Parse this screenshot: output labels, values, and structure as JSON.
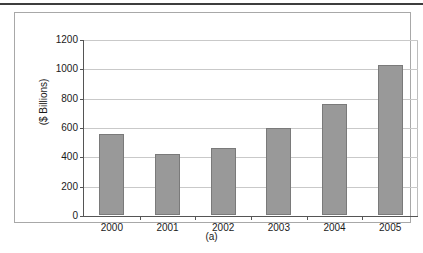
{
  "figure": {
    "caption": "(a)"
  },
  "chart_data": {
    "type": "bar",
    "title": "",
    "subtitle": "",
    "xlabel": "",
    "ylabel": "($ Billions)",
    "categories": [
      "2000",
      "2001",
      "2002",
      "2003",
      "2004",
      "2005"
    ],
    "values": [
      550,
      415,
      455,
      595,
      755,
      1025
    ],
    "series": [
      {
        "name": "",
        "values": [
          550,
          415,
          455,
          595,
          755,
          1025
        ]
      }
    ],
    "ylim": [
      0,
      1200
    ],
    "ytick_labels": [
      "0",
      "200",
      "400",
      "600",
      "800",
      "1000",
      "1200"
    ],
    "ytick_values": [
      0,
      200,
      400,
      600,
      800,
      1000,
      1200
    ],
    "grid": true,
    "legend": false,
    "legend_position": "none",
    "bar_color": "#999999",
    "bar_border_color": "#7a7a7a",
    "gridline_color": "#c9c9c9",
    "axis_color": "#555555",
    "background_color": "#ffffff"
  }
}
